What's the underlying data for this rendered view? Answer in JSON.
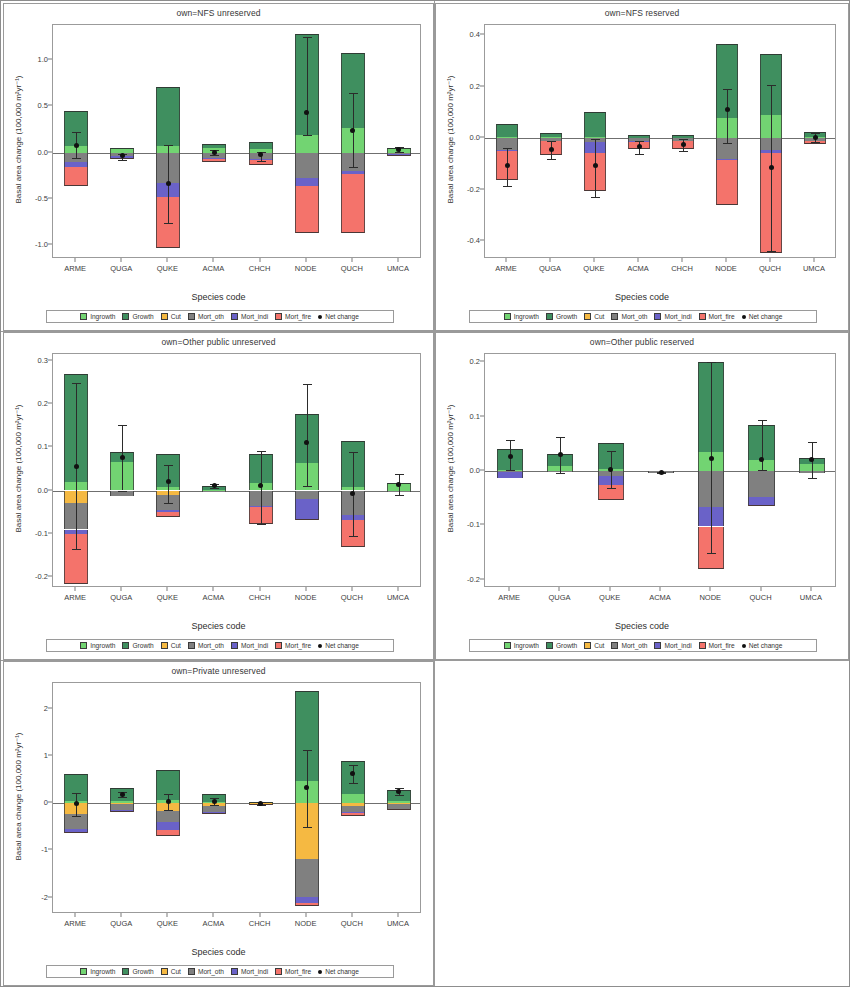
{
  "figure": {
    "axis_labels": {
      "y": "Basal area change (100,000 m²yr⁻¹)",
      "x": "Species code"
    },
    "legend": [
      {
        "label": "Ingrowth",
        "color": "#72d472",
        "key": "ingrowth"
      },
      {
        "label": "Growth",
        "color": "#3f8f5f",
        "key": "growth"
      },
      {
        "label": "Cut",
        "color": "#f5b942",
        "key": "cut"
      },
      {
        "label": "Mort_oth",
        "color": "#808080",
        "key": "mort_oth"
      },
      {
        "label": "Mort_indi",
        "color": "#6a62c8",
        "key": "mort_indi"
      },
      {
        "label": "Mort_fire",
        "color": "#f4736b",
        "key": "mort_fire"
      },
      {
        "label": "Net change",
        "color": "#111111",
        "key": "net_change"
      }
    ]
  },
  "chart_data": [
    {
      "type": "bar",
      "stacked": true,
      "title": "own=NFS unreserved",
      "xlabel": "Species code",
      "ylabel": "Basal area change (100,000 m²yr⁻¹)",
      "ylim": [
        -1.15,
        1.38
      ],
      "yticks": [
        1.0,
        0.5,
        0.0,
        -0.5,
        -1.0
      ],
      "ytick_labels": [
        "1.0",
        "0.5",
        "0.0",
        "-0.5",
        "-1.0"
      ],
      "categories": [
        "ARME",
        "QUGA",
        "QUKE",
        "ACMA",
        "CHCH",
        "NODE",
        "QUCH",
        "UMCA"
      ],
      "series": [
        {
          "name": "Ingrowth",
          "values": [
            0.075,
            0.035,
            0.07,
            0.055,
            0.035,
            0.195,
            0.265,
            0.035
          ]
        },
        {
          "name": "Growth",
          "values": [
            0.37,
            0.015,
            0.64,
            0.035,
            0.085,
            1.085,
            0.81,
            0.02
          ]
        },
        {
          "name": "Cut",
          "values": [
            0.0,
            0.0,
            0.0,
            0.0,
            0.0,
            0.0,
            0.0,
            0.0
          ]
        },
        {
          "name": "Mort_oth",
          "values": [
            -0.105,
            -0.04,
            -0.33,
            -0.055,
            -0.07,
            -0.27,
            -0.195,
            -0.02
          ]
        },
        {
          "name": "Mort_indi",
          "values": [
            -0.055,
            -0.02,
            -0.145,
            -0.015,
            -0.015,
            -0.09,
            -0.035,
            -0.005
          ]
        },
        {
          "name": "Mort_fire",
          "values": [
            -0.2,
            -0.005,
            -0.555,
            -0.03,
            -0.045,
            -0.505,
            -0.64,
            -0.005
          ]
        }
      ],
      "net_change": {
        "values": [
          0.08,
          -0.03,
          -0.335,
          0.005,
          -0.025,
          0.435,
          0.235,
          0.035
        ],
        "ci_upper": [
          0.225,
          -0.01,
          0.08,
          0.03,
          0.01,
          1.25,
          0.65,
          0.06
        ],
        "ci_lower": [
          -0.055,
          -0.075,
          -0.76,
          -0.025,
          -0.09,
          0.195,
          -0.15,
          0.01
        ]
      }
    },
    {
      "type": "bar",
      "stacked": true,
      "title": "own=NFS reserved",
      "xlabel": "Species code",
      "ylabel": "Basal area change (100,000 m²yr⁻¹)",
      "ylim": [
        -0.47,
        0.44
      ],
      "yticks": [
        0.4,
        0.2,
        0.0,
        -0.2,
        -0.4
      ],
      "ytick_labels": [
        "0.4",
        "0.2",
        "0.0",
        "-0.2",
        "-0.4"
      ],
      "categories": [
        "ARME",
        "QUGA",
        "QUKE",
        "ACMA",
        "CHCH",
        "NODE",
        "QUCH",
        "UMCA"
      ],
      "series": [
        {
          "name": "Ingrowth",
          "values": [
            0.004,
            0.003,
            0.004,
            0.002,
            0.002,
            0.078,
            0.089,
            0.003
          ]
        },
        {
          "name": "Growth",
          "values": [
            0.052,
            0.017,
            0.098,
            0.011,
            0.011,
            0.289,
            0.238,
            0.019
          ]
        },
        {
          "name": "Cut",
          "values": [
            0.0,
            0.0,
            0.0,
            0.0,
            0.0,
            0.0,
            0.0,
            0.0
          ]
        },
        {
          "name": "Mort_oth",
          "values": [
            -0.048,
            -0.01,
            -0.014,
            -0.012,
            -0.01,
            -0.081,
            -0.048,
            -0.011
          ]
        },
        {
          "name": "Mort_indi",
          "values": [
            -0.003,
            -0.002,
            -0.045,
            -0.002,
            -0.002,
            -0.004,
            -0.011,
            -0.002
          ]
        },
        {
          "name": "Mort_fire",
          "values": [
            -0.113,
            -0.052,
            -0.148,
            -0.028,
            -0.032,
            -0.176,
            -0.387,
            -0.01
          ]
        }
      ],
      "net_change": {
        "values": [
          -0.105,
          -0.045,
          -0.107,
          -0.033,
          -0.025,
          0.11,
          -0.116,
          0.003
        ],
        "ci_upper": [
          -0.04,
          -0.012,
          -0.005,
          -0.012,
          -0.002,
          0.192,
          0.205,
          0.019
        ],
        "ci_lower": [
          -0.186,
          -0.082,
          -0.228,
          -0.06,
          -0.05,
          -0.018,
          -0.44,
          -0.014
        ]
      }
    },
    {
      "type": "bar",
      "stacked": true,
      "title": "own=Other public unreserved",
      "xlabel": "Species code",
      "ylabel": "Basal area change (100,000 m²yr⁻¹)",
      "ylim": [
        -0.225,
        0.315
      ],
      "yticks": [
        0.3,
        0.2,
        0.1,
        0.0,
        -0.1,
        -0.2
      ],
      "ytick_labels": [
        "0.3",
        "0.2",
        "0.1",
        "0.0",
        "-0.1",
        "-0.2"
      ],
      "categories": [
        "ARME",
        "QUGA",
        "QUKE",
        "ACMA",
        "CHCH",
        "NODE",
        "QUCH",
        "UMCA"
      ],
      "series": [
        {
          "name": "Ingrowth",
          "values": [
            0.02,
            0.066,
            0.008,
            0.002,
            0.018,
            0.063,
            0.008,
            0.015
          ]
        },
        {
          "name": "Growth",
          "values": [
            0.249,
            0.022,
            0.076,
            0.009,
            0.067,
            0.114,
            0.107,
            0.003
          ]
        },
        {
          "name": "Cut",
          "values": [
            -0.028,
            0.0,
            -0.01,
            0.0,
            0.0,
            0.0,
            0.0,
            0.0
          ]
        },
        {
          "name": "Mort_oth",
          "values": [
            -0.062,
            -0.013,
            -0.036,
            -0.001,
            -0.036,
            -0.02,
            -0.057,
            -0.002
          ]
        },
        {
          "name": "Mort_indi",
          "values": [
            -0.011,
            0.0,
            -0.003,
            0.0,
            -0.002,
            -0.046,
            -0.01,
            0.0
          ]
        },
        {
          "name": "Mort_fire",
          "values": [
            -0.114,
            0.0,
            -0.013,
            0.0,
            -0.039,
            -0.003,
            -0.063,
            0.0
          ]
        }
      ],
      "net_change": {
        "values": [
          0.055,
          0.077,
          0.02,
          0.011,
          0.012,
          0.111,
          -0.008,
          0.014
        ],
        "ci_upper": [
          0.248,
          0.152,
          0.06,
          0.016,
          0.092,
          0.245,
          0.09,
          0.037
        ],
        "ci_lower": [
          -0.135,
          0.0,
          -0.028,
          0.006,
          -0.077,
          0.01,
          -0.104,
          -0.01
        ]
      }
    },
    {
      "type": "bar",
      "stacked": true,
      "title": "own=Other public reserved",
      "xlabel": "Species code",
      "ylabel": "Basal area change (100,000 m²yr⁻¹)",
      "ylim": [
        -0.215,
        0.215
      ],
      "yticks": [
        0.2,
        0.1,
        0.0,
        -0.1,
        -0.2
      ],
      "ytick_labels": [
        "0.2",
        "0.1",
        "0.0",
        "-0.1",
        "-0.2"
      ],
      "categories": [
        "ARME",
        "QUGA",
        "QUKE",
        "ACMA",
        "NODE",
        "QUCH",
        "UMCA"
      ],
      "series": [
        {
          "name": "Ingrowth",
          "values": [
            0.002,
            0.01,
            0.003,
            0.0,
            0.034,
            0.02,
            0.013
          ]
        },
        {
          "name": "Growth",
          "values": [
            0.038,
            0.022,
            0.049,
            0.0,
            0.167,
            0.064,
            0.011
          ]
        },
        {
          "name": "Cut",
          "values": [
            0.0,
            0.0,
            0.0,
            0.0,
            0.0,
            0.0,
            0.0
          ]
        },
        {
          "name": "Mort_oth",
          "values": [
            -0.002,
            -0.001,
            -0.01,
            -0.003,
            -0.067,
            -0.048,
            -0.004
          ]
        },
        {
          "name": "Mort_indi",
          "values": [
            -0.01,
            0.0,
            -0.015,
            0.0,
            -0.035,
            -0.014,
            0.0
          ]
        },
        {
          "name": "Mort_fire",
          "values": [
            0.0,
            0.0,
            -0.028,
            0.0,
            -0.079,
            -0.001,
            0.0
          ]
        }
      ],
      "net_change": {
        "values": [
          0.026,
          0.031,
          0.002,
          -0.003,
          0.023,
          0.022,
          0.021
        ],
        "ci_upper": [
          0.057,
          0.063,
          0.036,
          -0.002,
          0.2,
          0.094,
          0.054
        ],
        "ci_lower": [
          0.002,
          -0.004,
          -0.032,
          -0.004,
          -0.15,
          0.001,
          -0.013
        ]
      }
    },
    {
      "type": "bar",
      "stacked": true,
      "title": "own=Private unreserved",
      "xlabel": "Species code",
      "ylabel": "Basal area change (100,000 m²yr⁻¹)",
      "ylim": [
        -2.35,
        2.55
      ],
      "yticks": [
        2,
        1,
        0,
        -1,
        -2
      ],
      "ytick_labels": [
        "2",
        "1",
        "0",
        "-1",
        "-2"
      ],
      "categories": [
        "ARME",
        "QUGA",
        "QUKE",
        "ACMA",
        "CHCH",
        "NODE",
        "QUCH",
        "UMCA"
      ],
      "series": [
        {
          "name": "Ingrowth",
          "values": [
            0.055,
            0.04,
            0.06,
            0.025,
            0.006,
            0.47,
            0.2,
            0.04
          ]
        },
        {
          "name": "Growth",
          "values": [
            0.565,
            0.275,
            0.65,
            0.18,
            0.02,
            1.915,
            0.69,
            0.24
          ]
        },
        {
          "name": "Cut",
          "values": [
            -0.23,
            -0.02,
            -0.175,
            -0.055,
            -0.01,
            -1.19,
            -0.06,
            -0.02
          ]
        },
        {
          "name": "Mort_oth",
          "values": [
            -0.315,
            -0.13,
            -0.225,
            -0.135,
            -0.01,
            -0.79,
            -0.13,
            -0.1
          ]
        },
        {
          "name": "Mort_indi",
          "values": [
            -0.06,
            -0.015,
            -0.175,
            -0.015,
            -0.002,
            -0.14,
            -0.02,
            -0.01
          ]
        },
        {
          "name": "Mort_fire",
          "values": [
            -0.035,
            -0.002,
            -0.13,
            -0.005,
            -0.001,
            -0.06,
            -0.065,
            -0.005
          ]
        }
      ],
      "net_change": {
        "values": [
          0.0,
          0.185,
          0.03,
          0.04,
          -0.01,
          0.33,
          0.64,
          0.255
        ],
        "ci_upper": [
          0.215,
          0.245,
          0.2,
          0.105,
          0.02,
          1.12,
          0.81,
          0.33
        ],
        "ci_lower": [
          -0.275,
          0.13,
          -0.14,
          -0.03,
          -0.04,
          -0.5,
          0.435,
          0.18
        ]
      }
    }
  ]
}
